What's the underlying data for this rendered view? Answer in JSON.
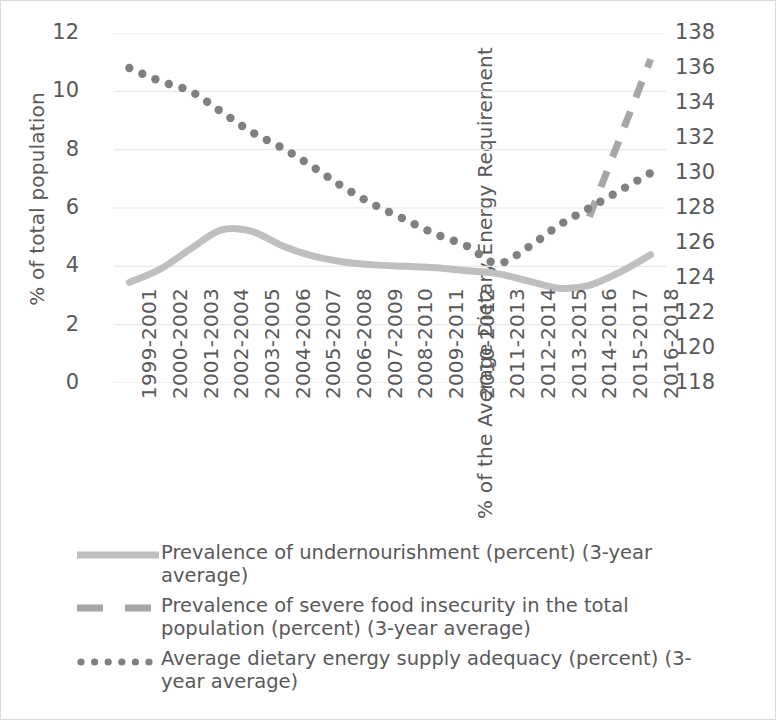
{
  "chart_data": {
    "type": "line",
    "title": "",
    "categories": [
      "1999-2001",
      "2000-2002",
      "2001-2003",
      "2002-2004",
      "2003-2005",
      "2004-2006",
      "2005-2007",
      "2006-2008",
      "2007-2009",
      "2008-2010",
      "2009-2011",
      "2010-2012",
      "2011-2013",
      "2012-2014",
      "2013-2015",
      "2014-2016",
      "2015-2017",
      "2016-2018"
    ],
    "series": [
      {
        "name": "Prevalence of undernourishment (percent) (3-year average)",
        "axis": "left",
        "style": "solid",
        "color": "#bfbfbf",
        "values": [
          3.45,
          3.9,
          4.6,
          5.25,
          5.2,
          4.7,
          4.35,
          4.15,
          4.05,
          4.0,
          3.95,
          3.85,
          3.75,
          3.5,
          3.25,
          3.35,
          3.8,
          4.4
        ]
      },
      {
        "name": "Prevalence of severe food insecurity in the total population (percent) (3-year average)",
        "axis": "left",
        "style": "dashed",
        "color": "#a6a6a6",
        "values": [
          null,
          null,
          null,
          null,
          null,
          null,
          null,
          null,
          null,
          null,
          null,
          null,
          null,
          null,
          null,
          5.7,
          8.4,
          11.1
        ]
      },
      {
        "name": "Average dietary energy supply adequacy (percent) (3-year average)",
        "axis": "right",
        "style": "dotted",
        "color": "#808080",
        "values": [
          10.8,
          10.35,
          10.0,
          9.35,
          8.65,
          8.05,
          7.45,
          6.7,
          6.15,
          5.6,
          5.15,
          4.75,
          4.1,
          4.6,
          5.35,
          5.9,
          6.6,
          7.2
        ],
        "values_right_axis": [
          136.0,
          135.5,
          135.0,
          134.4,
          133.6,
          133.0,
          132.4,
          131.7,
          131.1,
          130.6,
          130.1,
          129.8,
          128.1,
          128.6,
          129.4,
          129.9,
          130.6,
          131.2
        ]
      }
    ],
    "dotted_plot_values": [
      10.8,
      10.35,
      10.0,
      9.35,
      8.65,
      8.05,
      7.45,
      6.7,
      6.15,
      5.6,
      5.15,
      4.75,
      4.1,
      4.6,
      5.35,
      5.9,
      6.6,
      7.3,
      7.7,
      7.75
    ],
    "dotted_series_left_scale": [
      10.8,
      10.35,
      10.0,
      9.3,
      8.6,
      8.05,
      7.4,
      6.7,
      6.1,
      5.6,
      5.1,
      4.7,
      4.1,
      4.65,
      5.4,
      6.0,
      6.6,
      7.2
    ],
    "xlabel": "",
    "ylabel_left": "% of total population",
    "ylabel_right": "% of the Average Dietary Energy Requirement",
    "ylim_left": [
      0,
      12
    ],
    "ylim_right": [
      118,
      138
    ],
    "yticks_left": [
      "0",
      "2",
      "4",
      "6",
      "8",
      "10",
      "12"
    ],
    "yticks_right": [
      "118",
      "120",
      "122",
      "124",
      "126",
      "128",
      "130",
      "132",
      "134",
      "136",
      "138"
    ],
    "grid": true,
    "legend_position": "bottom"
  },
  "axes": {
    "left_title": "% of total population",
    "right_title": "% of the Average Dietary Energy Requirement",
    "left_ticks": [
      "12",
      "10",
      "8",
      "6",
      "4",
      "2",
      "0"
    ],
    "right_ticks": [
      "138",
      "136",
      "134",
      "132",
      "130",
      "128",
      "126",
      "124",
      "122",
      "120",
      "118"
    ]
  },
  "xlabels": [
    "1999-2001",
    "2000-2002",
    "2001-2003",
    "2002-2004",
    "2003-2005",
    "2004-2006",
    "2005-2007",
    "2006-2008",
    "2007-2009",
    "2008-2010",
    "2009-2011",
    "2010-2012",
    "2011-2013",
    "2012-2014",
    "2013-2015",
    "2014-2016",
    "2015-2017",
    "2016-2018"
  ],
  "legend": {
    "items": [
      {
        "label": "Prevalence of undernourishment (percent) (3-year average)",
        "style": "solid",
        "color": "#bfbfbf"
      },
      {
        "label": "Prevalence of severe food insecurity in the total population (percent) (3-year average)",
        "style": "dashed",
        "color": "#a6a6a6"
      },
      {
        "label": "Average dietary energy supply adequacy (percent) (3-year average)",
        "style": "dotted",
        "color": "#808080"
      }
    ]
  },
  "colors": {
    "grid": "#e8e8e8",
    "text": "#595959",
    "border": "#d9d9d9",
    "solid_series": "#bfbfbf",
    "dashed_series": "#a6a6a6",
    "dotted_series": "#808080"
  }
}
